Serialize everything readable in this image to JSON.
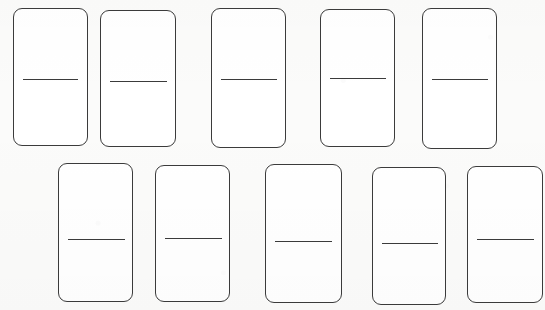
{
  "scene": {
    "width": 545,
    "height": 310,
    "background_color": "#fbfbfa",
    "description": "Ten blank dominoes arranged in two rows of five"
  },
  "style": {
    "tile_fill_color": "#ffffff",
    "tile_outline_color": "#3b3b3b",
    "divider_color": "#3b3b3b",
    "outline_width_px": 1.4,
    "corner_radius_px": 9
  },
  "rows": [
    {
      "name": "top-row",
      "label": "Top row",
      "count": 5
    },
    {
      "name": "bottom-row",
      "label": "Bottom row",
      "count": 5
    }
  ],
  "dominoes": [
    {
      "id": "domino-top-1",
      "row": "top",
      "index": 1,
      "top_pips": 0,
      "bottom_pips": 0,
      "value_label": "0-0",
      "x": 13,
      "y": 8,
      "w": 75,
      "h": 138,
      "divider_x": 23,
      "divider_y": 79,
      "divider_w": 55
    },
    {
      "id": "domino-top-2",
      "row": "top",
      "index": 2,
      "top_pips": 0,
      "bottom_pips": 0,
      "value_label": "0-0",
      "x": 100,
      "y": 10,
      "w": 76,
      "h": 137,
      "divider_x": 110,
      "divider_y": 81,
      "divider_w": 57
    },
    {
      "id": "domino-top-3",
      "row": "top",
      "index": 3,
      "top_pips": 0,
      "bottom_pips": 0,
      "value_label": "0-0",
      "x": 211,
      "y": 8,
      "w": 75,
      "h": 140,
      "divider_x": 221,
      "divider_y": 79,
      "divider_w": 56
    },
    {
      "id": "domino-top-4",
      "row": "top",
      "index": 4,
      "top_pips": 0,
      "bottom_pips": 0,
      "value_label": "0-0",
      "x": 320,
      "y": 9,
      "w": 75,
      "h": 138,
      "divider_x": 330,
      "divider_y": 78,
      "divider_w": 56
    },
    {
      "id": "domino-top-5",
      "row": "top",
      "index": 5,
      "top_pips": 0,
      "bottom_pips": 0,
      "value_label": "0-0",
      "x": 422,
      "y": 8,
      "w": 75,
      "h": 141,
      "divider_x": 432,
      "divider_y": 79,
      "divider_w": 56
    },
    {
      "id": "domino-bottom-1",
      "row": "bottom",
      "index": 1,
      "top_pips": 0,
      "bottom_pips": 0,
      "value_label": "0-0",
      "x": 58,
      "y": 163,
      "w": 75,
      "h": 139,
      "divider_x": 68,
      "divider_y": 239,
      "divider_w": 57
    },
    {
      "id": "domino-bottom-2",
      "row": "bottom",
      "index": 2,
      "top_pips": 0,
      "bottom_pips": 0,
      "value_label": "0-0",
      "x": 155,
      "y": 165,
      "w": 75,
      "h": 137,
      "divider_x": 165,
      "divider_y": 238,
      "divider_w": 57
    },
    {
      "id": "domino-bottom-3",
      "row": "bottom",
      "index": 3,
      "top_pips": 0,
      "bottom_pips": 0,
      "value_label": "0-0",
      "x": 265,
      "y": 164,
      "w": 77,
      "h": 139,
      "divider_x": 275,
      "divider_y": 241,
      "divider_w": 57
    },
    {
      "id": "domino-bottom-4",
      "row": "bottom",
      "index": 4,
      "top_pips": 0,
      "bottom_pips": 0,
      "value_label": "0-0",
      "x": 372,
      "y": 167,
      "w": 74,
      "h": 138,
      "divider_x": 382,
      "divider_y": 243,
      "divider_w": 56
    },
    {
      "id": "domino-bottom-5",
      "row": "bottom",
      "index": 5,
      "top_pips": 0,
      "bottom_pips": 0,
      "value_label": "0-0",
      "x": 467,
      "y": 166,
      "w": 76,
      "h": 137,
      "divider_x": 477,
      "divider_y": 239,
      "divider_w": 57
    }
  ]
}
